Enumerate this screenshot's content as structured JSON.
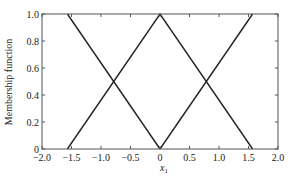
{
  "chart_data": {
    "type": "line",
    "title": "",
    "xlabel": "x1",
    "xlabel_main": "x",
    "xlabel_sub": "1",
    "ylabel": "Membership function",
    "xlim": [
      -2.0,
      2.0
    ],
    "ylim": [
      0,
      1.0
    ],
    "grid": false,
    "legend": null,
    "xticks": [
      -2.0,
      -1.5,
      -1.0,
      -0.5,
      0,
      0.5,
      1.0,
      1.5,
      2.0
    ],
    "xtick_labels": [
      "−2.0",
      "−1.5",
      "−1.0",
      "−0.5",
      "0",
      "0.5",
      "1.0",
      "1.5",
      "2.0"
    ],
    "yticks": [
      0,
      0.2,
      0.4,
      0.6,
      0.8,
      1.0
    ],
    "ytick_labels": [
      "0",
      "0.2",
      "0.4",
      "0.6",
      "0.8",
      "1.0"
    ],
    "series": [
      {
        "name": "negative",
        "x": [
          -1.57,
          0
        ],
        "y": [
          1.0,
          0
        ]
      },
      {
        "name": "zero",
        "x": [
          -1.57,
          0,
          1.57
        ],
        "y": [
          0,
          1.0,
          0
        ]
      },
      {
        "name": "positive",
        "x": [
          0,
          1.57
        ],
        "y": [
          0,
          1.0
        ]
      }
    ],
    "line_color": "#222222"
  }
}
